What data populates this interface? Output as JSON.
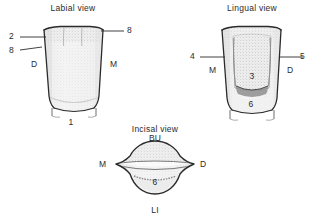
{
  "figure": {
    "kind": "dental-anatomy-line-drawing",
    "background_color": "#ffffff",
    "ink_color": "#2b2b2b",
    "fill_color": "#f2f2f2",
    "stipple_color": "#9a9a9a"
  },
  "views": {
    "labial": {
      "title": "Labial view",
      "leaders": [
        {
          "id": "labial-leader-2",
          "label": "2",
          "side": "left"
        },
        {
          "id": "labial-leader-8-left",
          "label": "8",
          "side": "left"
        },
        {
          "id": "labial-leader-8-right",
          "label": "8",
          "side": "right"
        }
      ],
      "orientation": {
        "left": "D",
        "right": "M"
      },
      "inner_numbers": [
        {
          "id": "labial-number-1",
          "label": "1"
        }
      ]
    },
    "lingual": {
      "title": "Lingual view",
      "leaders": [
        {
          "id": "lingual-leader-4",
          "label": "4",
          "side": "left"
        },
        {
          "id": "lingual-leader-5",
          "label": "5",
          "side": "right"
        }
      ],
      "orientation": {
        "left": "M",
        "right": "D"
      },
      "inner_numbers": [
        {
          "id": "lingual-number-3",
          "label": "3"
        },
        {
          "id": "lingual-number-6",
          "label": "6"
        }
      ]
    },
    "incisal": {
      "title": "Incisal view",
      "orientation": {
        "top": "BU",
        "bottom": "LI",
        "left": "M",
        "right": "D"
      },
      "inner_numbers": [
        {
          "id": "incisal-number-6",
          "label": "6"
        }
      ]
    }
  }
}
